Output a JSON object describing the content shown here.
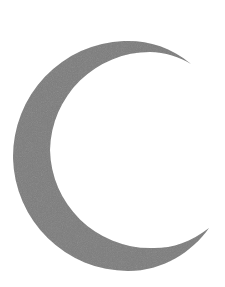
{
  "image": {
    "label": "Crescent moon",
    "icon": "crescent-moon-icon",
    "background_color": "#ffffff",
    "fill_color": "#7b7b7b",
    "width": 225,
    "height": 287
  }
}
